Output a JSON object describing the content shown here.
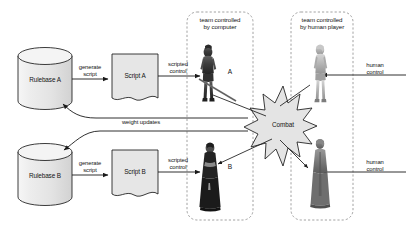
{
  "diagram": {
    "colors": {
      "stroke": "#1a1a1a",
      "cylinder_fill": "#e9e9e9",
      "cylinder_top": "#f2f2f2",
      "script_fill": "#e4e4e4",
      "combat_fill": "#e2e2e2",
      "dashed_stroke": "#8a8a8a",
      "text": "#141414",
      "figure_dark": "#3a3a3a",
      "figure_light": "#b9b9b9"
    },
    "nodes": {
      "rulebase_a": {
        "label": "Rulebase A",
        "shape": "cylinder"
      },
      "rulebase_b": {
        "label": "Rulebase B",
        "shape": "cylinder"
      },
      "script_a": {
        "label": "Script A",
        "shape": "document"
      },
      "script_b": {
        "label": "Script B",
        "shape": "document"
      },
      "combat": {
        "label": "Combat",
        "shape": "starburst"
      }
    },
    "edges": {
      "generate_script_a": {
        "label": "generate\nscript"
      },
      "generate_script_b": {
        "label": "generate\nscript"
      },
      "scripted_control_a": {
        "label": "scripted\ncontrol"
      },
      "scripted_control_b": {
        "label": "scripted\ncontrol"
      },
      "weight_updates": {
        "label": "weight updates"
      },
      "human_control_top": {
        "label": "human\ncontrol"
      },
      "human_control_bottom": {
        "label": "human\ncontrol"
      }
    },
    "groups": {
      "computer_team": {
        "label": "team controlled\nby computer"
      },
      "human_team": {
        "label": "team controlled\nby human player"
      }
    },
    "characters": {
      "agent_a": {
        "label": "A",
        "team": "computer"
      },
      "agent_b": {
        "label": "B",
        "team": "computer"
      },
      "human_top": {
        "label": "",
        "team": "human"
      },
      "human_bottom": {
        "label": "",
        "team": "human"
      }
    }
  }
}
